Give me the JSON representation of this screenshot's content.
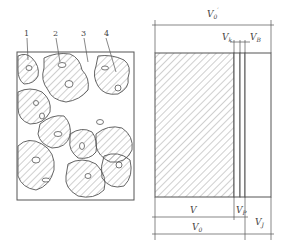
{
  "left_figure": {
    "title": "Aggregate particle structure",
    "callouts": [
      {
        "id": "1",
        "label": "1"
      },
      {
        "id": "2",
        "label": "2"
      },
      {
        "id": "3",
        "label": "3"
      },
      {
        "id": "4",
        "label": "4"
      }
    ]
  },
  "right_figure": {
    "title": "Volume composition",
    "dimensions": {
      "top_total": {
        "main": "V",
        "sub": "0",
        "sup": "′"
      },
      "closed_pore": {
        "main": "V",
        "sub": "k"
      },
      "open_pore": {
        "main": "V",
        "sub": "B"
      },
      "solid": {
        "main": "V",
        "sub": ""
      },
      "pore": {
        "main": "V",
        "sub": "P"
      },
      "bulk": {
        "main": "V",
        "sub": "0"
      },
      "void": {
        "main": "V",
        "sub": "J"
      }
    }
  },
  "colors": {
    "line": "#555555",
    "hatch": "#888888",
    "background": "#ffffff"
  }
}
